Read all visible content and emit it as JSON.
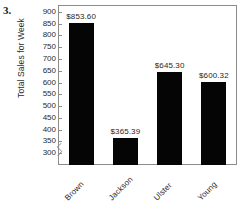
{
  "figure": {
    "exercise_number": "3."
  },
  "chart_data": {
    "type": "bar",
    "title": "",
    "xlabel": "",
    "ylabel": "Total Sales for Week",
    "categories": [
      "Brown",
      "Jackson",
      "Ulster",
      "Young"
    ],
    "values": [
      853.6,
      365.39,
      645.3,
      600.32
    ],
    "value_labels": [
      "$853.60",
      "$365.39",
      "$645.30",
      "$600.32"
    ],
    "ylim": [
      250,
      925
    ],
    "y_ticks": [
      900,
      850,
      800,
      750,
      700,
      650,
      600,
      550,
      500,
      450,
      400,
      350,
      300
    ],
    "y_tick_labels": [
      "900",
      "850",
      "800",
      "750",
      "700",
      "650",
      "600",
      "550",
      "500",
      "450",
      "400",
      "350",
      "300"
    ],
    "grid": false,
    "legend": false,
    "axis_break": true,
    "bar_color": "#050505",
    "axis_color": "#8c8c8c",
    "text_color": "#2b2b2b"
  }
}
